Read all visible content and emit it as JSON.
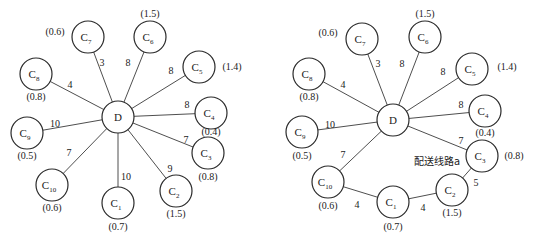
{
  "diagrams": [
    {
      "id": "left",
      "caption": "",
      "depot": {
        "label": "D",
        "x": 118,
        "y": 117,
        "r": 16
      },
      "customers": [
        {
          "name": "C",
          "sub": "1",
          "x": 118,
          "y": 203,
          "demand": "(0.7)",
          "dx": 118,
          "dy": 230
        },
        {
          "name": "C",
          "sub": "2",
          "x": 176,
          "y": 191,
          "demand": "(1.5)",
          "dx": 176,
          "dy": 217
        },
        {
          "name": "C",
          "sub": "3",
          "x": 208,
          "y": 153,
          "demand": "(0.8)",
          "dx": 208,
          "dy": 180
        },
        {
          "name": "C",
          "sub": "4",
          "x": 211,
          "y": 113,
          "demand": "(0.4)",
          "dx": 211,
          "dy": 135
        },
        {
          "name": "C",
          "sub": "5",
          "x": 199,
          "y": 67,
          "demand": "(1.4)",
          "dx": 232,
          "dy": 70
        },
        {
          "name": "C",
          "sub": "6",
          "x": 150,
          "y": 37,
          "demand": "(1.5)",
          "dx": 150,
          "dy": 17
        },
        {
          "name": "C",
          "sub": "7",
          "x": 88,
          "y": 37,
          "demand": "(0.6)",
          "dx": 55,
          "dy": 35
        },
        {
          "name": "C",
          "sub": "8",
          "x": 36,
          "y": 74,
          "demand": "(0.8)",
          "dx": 36,
          "dy": 100
        },
        {
          "name": "C",
          "sub": "9",
          "x": 27,
          "y": 133,
          "demand": "(0.5)",
          "dx": 27,
          "dy": 159
        },
        {
          "name": "C",
          "sub": "10",
          "x": 52,
          "y": 185,
          "demand": "(0.6)",
          "dx": 52,
          "dy": 211
        }
      ],
      "edges": [
        {
          "from": "D",
          "to": "1",
          "weight": "10",
          "lx": 126,
          "ly": 180
        },
        {
          "from": "D",
          "to": "2",
          "weight": "9",
          "lx": 170,
          "ly": 172
        },
        {
          "from": "D",
          "to": "3",
          "weight": "7",
          "lx": 186,
          "ly": 143
        },
        {
          "from": "D",
          "to": "4",
          "weight": "8",
          "lx": 187,
          "ly": 108
        },
        {
          "from": "D",
          "to": "5",
          "weight": "8",
          "lx": 171,
          "ly": 74
        },
        {
          "from": "D",
          "to": "6",
          "weight": "8",
          "lx": 128,
          "ly": 66
        },
        {
          "from": "D",
          "to": "7",
          "weight": "3",
          "lx": 102,
          "ly": 66
        },
        {
          "from": "D",
          "to": "8",
          "weight": "4",
          "lx": 70,
          "ly": 88
        },
        {
          "from": "D",
          "to": "9",
          "weight": "10",
          "lx": 55,
          "ly": 127
        },
        {
          "from": "D",
          "to": "10",
          "weight": "7",
          "lx": 69,
          "ly": 156
        }
      ]
    },
    {
      "id": "right",
      "route_label": "配送线路a",
      "caption": "",
      "depot": {
        "label": "D",
        "x": 393,
        "y": 120,
        "r": 16
      },
      "customers": [
        {
          "name": "C",
          "sub": "1",
          "x": 393,
          "y": 202,
          "demand": "(0.7)",
          "dx": 393,
          "dy": 230
        },
        {
          "name": "C",
          "sub": "2",
          "x": 452,
          "y": 190,
          "demand": "(1.5)",
          "dx": 452,
          "dy": 216
        },
        {
          "name": "C",
          "sub": "3",
          "x": 482,
          "y": 156,
          "demand": "(0.8)",
          "dx": 514,
          "dy": 159
        },
        {
          "name": "C",
          "sub": "4",
          "x": 485,
          "y": 111,
          "demand": "(0.4)",
          "dx": 485,
          "dy": 136
        },
        {
          "name": "C",
          "sub": "5",
          "x": 472,
          "y": 69,
          "demand": "(1.4)",
          "dx": 507,
          "dy": 70
        },
        {
          "name": "C",
          "sub": "6",
          "x": 425,
          "y": 37,
          "demand": "(1.5)",
          "dx": 425,
          "dy": 17
        },
        {
          "name": "C",
          "sub": "7",
          "x": 362,
          "y": 39,
          "demand": "(0.6)",
          "dx": 328,
          "dy": 36
        },
        {
          "name": "C",
          "sub": "8",
          "x": 309,
          "y": 74,
          "demand": "(0.8)",
          "dx": 309,
          "dy": 100
        },
        {
          "name": "C",
          "sub": "9",
          "x": 302,
          "y": 132,
          "demand": "(0.5)",
          "dx": 302,
          "dy": 159
        },
        {
          "name": "C",
          "sub": "10",
          "x": 328,
          "y": 182,
          "demand": "(0.6)",
          "dx": 328,
          "dy": 209
        }
      ],
      "edges": [
        {
          "from": "D",
          "to": "3",
          "weight": "7",
          "lx": 461,
          "ly": 144
        },
        {
          "from": "D",
          "to": "4",
          "weight": "8",
          "lx": 461,
          "ly": 108
        },
        {
          "from": "D",
          "to": "5",
          "weight": "8",
          "lx": 443,
          "ly": 75
        },
        {
          "from": "D",
          "to": "6",
          "weight": "8",
          "lx": 402,
          "ly": 67
        },
        {
          "from": "D",
          "to": "7",
          "weight": "3",
          "lx": 378,
          "ly": 67
        },
        {
          "from": "D",
          "to": "8",
          "weight": "4",
          "lx": 343,
          "ly": 88
        },
        {
          "from": "D",
          "to": "9",
          "weight": "10",
          "lx": 330,
          "ly": 128
        },
        {
          "from": "D",
          "to": "10",
          "weight": "7",
          "lx": 343,
          "ly": 158
        },
        {
          "from": "10",
          "to": "1",
          "weight": "4",
          "lx": 357,
          "ly": 208
        },
        {
          "from": "1",
          "to": "2",
          "weight": "4",
          "lx": 423,
          "ly": 211
        },
        {
          "from": "2",
          "to": "3",
          "weight": "5",
          "lx": 476,
          "ly": 186
        }
      ],
      "route_label_pos": {
        "x": 437,
        "y": 165
      }
    }
  ]
}
